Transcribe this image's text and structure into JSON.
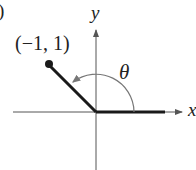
{
  "figure": {
    "part_label_fragment": ")",
    "axes": {
      "x_label": "x",
      "y_label": "y"
    },
    "point": {
      "label": "(−1, 1)",
      "x": -1,
      "y": 1
    },
    "angle": {
      "label": "θ",
      "direction": "counterclockwise",
      "initial_side": "positive x-axis",
      "terminal_side": "through (−1, 1)"
    },
    "colors": {
      "ink": "#1a1a1a",
      "axis": "#555555",
      "arc": "#777777"
    }
  }
}
